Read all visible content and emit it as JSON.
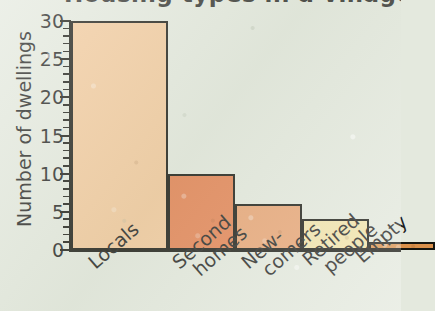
{
  "title_partial": "Housing types in a village",
  "chart_data": {
    "type": "bar",
    "title": "",
    "xlabel": "",
    "ylabel": "Number of dwellings",
    "categories": [
      "Locals",
      "Second homes",
      "New-comers",
      "Retired people",
      "Empty"
    ],
    "category_lines": [
      [
        "Locals"
      ],
      [
        "Second",
        "homes"
      ],
      [
        "New-",
        "comers"
      ],
      [
        "Retired",
        "people"
      ],
      [
        "Empty"
      ]
    ],
    "values": [
      30,
      10,
      6,
      4,
      1
    ],
    "ylim": [
      0,
      30
    ],
    "ytick_labels": [
      "0",
      "5",
      "10",
      "15",
      "20",
      "25",
      "30"
    ],
    "ytick_values": [
      0,
      5,
      10,
      15,
      20,
      25,
      30
    ],
    "minor_tick_step": 1,
    "grid": false,
    "legend": "none",
    "bar_colors": [
      "#f3c99b",
      "#e4804f",
      "#e8a271",
      "#f2e3a9",
      "#d9904b"
    ],
    "bar_edge_color": "#15150f",
    "background_color": "#e4e9de",
    "text_color": "#1e1e1c"
  }
}
